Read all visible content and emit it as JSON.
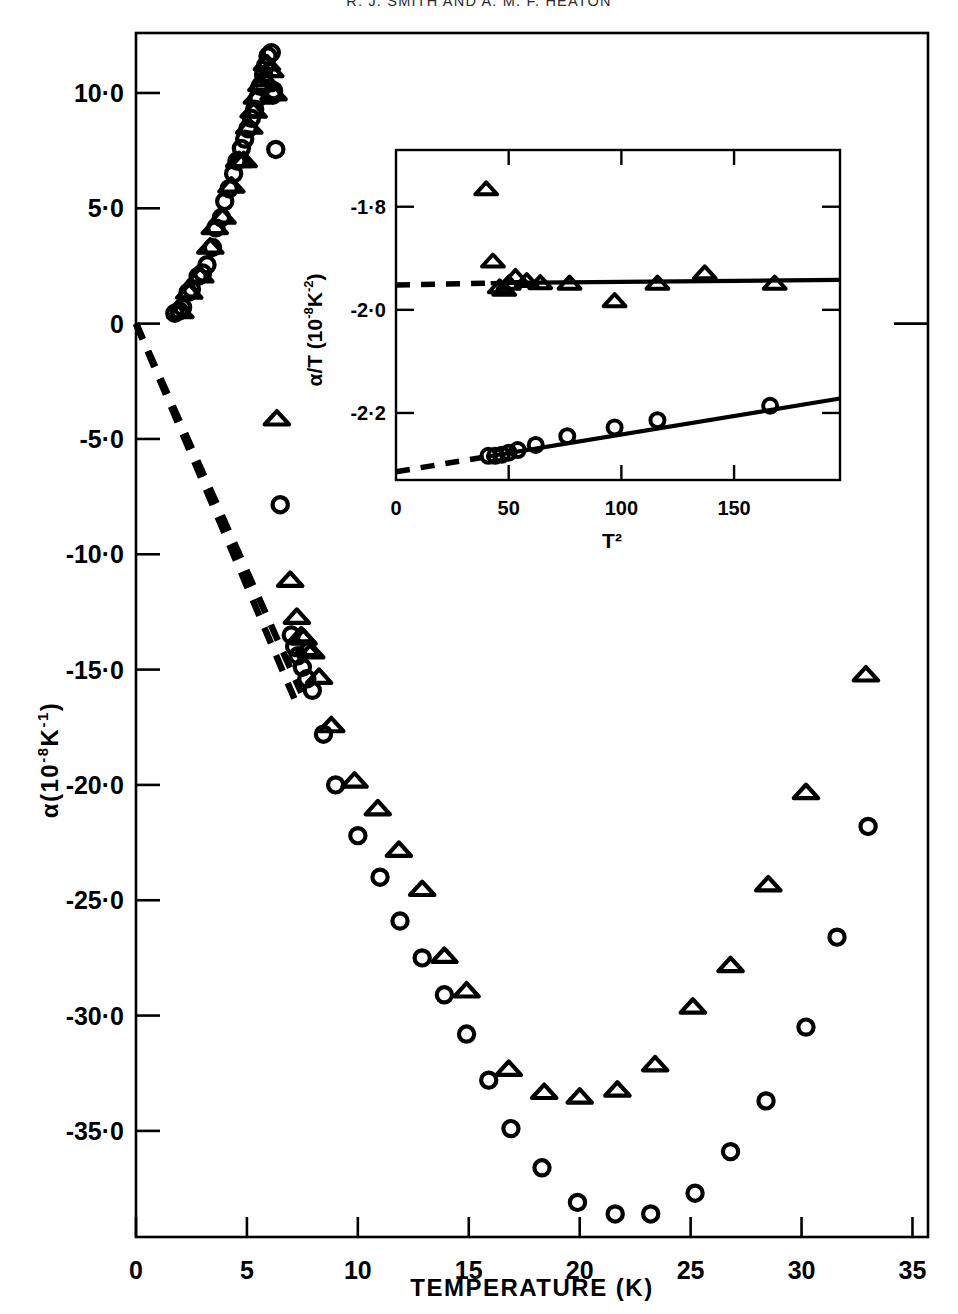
{
  "page": {
    "running_head": "R. J. SMITH AND A. M. F. HEATON"
  },
  "chart_data": {
    "type": "scatter",
    "title": "",
    "xlabel": "TEMPERATURE  (K)",
    "ylabel": "α(10⁻⁸K⁻¹)",
    "ylabel_parts": {
      "symbol": "α(10",
      "exp1": "-8",
      "mid": "K",
      "exp2": "-1",
      "close": ")"
    },
    "xlim": [
      0,
      35.7
    ],
    "ylim": [
      -39.6,
      12.6
    ],
    "xticks": [
      0,
      5,
      10,
      15,
      20,
      25,
      30,
      35
    ],
    "xticklabels": [
      "0",
      "5",
      "10",
      "15",
      "20",
      "25",
      "30",
      "35"
    ],
    "yticks": [
      10,
      5,
      0,
      -5,
      -10,
      -15,
      -20,
      -25,
      -30,
      -35
    ],
    "yticklabels": [
      "10·0",
      "5·0",
      "0",
      "-5·0",
      "-10·0",
      "-15·0",
      "-20·0",
      "-25·0",
      "-30·0",
      "-35·0"
    ],
    "grid": false,
    "legend": "none",
    "series": [
      {
        "name": "circles",
        "marker": "open-circle",
        "points": [
          [
            1.75,
            0.45
          ],
          [
            1.95,
            0.55
          ],
          [
            2.1,
            0.7
          ],
          [
            2.35,
            1.35
          ],
          [
            2.5,
            1.5
          ],
          [
            2.8,
            2.05
          ],
          [
            3.0,
            2.2
          ],
          [
            3.2,
            2.55
          ],
          [
            3.45,
            3.3
          ],
          [
            3.6,
            4.15
          ],
          [
            3.85,
            4.6
          ],
          [
            4.0,
            5.3
          ],
          [
            4.2,
            5.85
          ],
          [
            4.4,
            6.5
          ],
          [
            4.55,
            7.05
          ],
          [
            4.75,
            7.6
          ],
          [
            4.9,
            8.0
          ],
          [
            5.05,
            8.45
          ],
          [
            5.2,
            8.9
          ],
          [
            5.35,
            9.3
          ],
          [
            5.5,
            9.8
          ],
          [
            5.6,
            10.3
          ],
          [
            5.75,
            10.8
          ],
          [
            5.85,
            11.2
          ],
          [
            5.95,
            11.6
          ],
          [
            6.1,
            11.75
          ],
          [
            6.15,
            9.9
          ],
          [
            6.2,
            10.1
          ],
          [
            6.3,
            7.55
          ],
          [
            6.5,
            -7.85
          ],
          [
            7.0,
            -13.5
          ],
          [
            7.15,
            -14.0
          ],
          [
            7.3,
            -14.4
          ],
          [
            7.5,
            -14.9
          ],
          [
            7.7,
            -15.4
          ],
          [
            7.95,
            -15.9
          ],
          [
            8.45,
            -17.8
          ],
          [
            9.0,
            -20.0
          ],
          [
            10.0,
            -22.2
          ],
          [
            11.0,
            -24.0
          ],
          [
            11.9,
            -25.9
          ],
          [
            12.9,
            -27.5
          ],
          [
            13.9,
            -29.1
          ],
          [
            14.9,
            -30.8
          ],
          [
            15.9,
            -32.8
          ],
          [
            16.9,
            -34.9
          ],
          [
            18.3,
            -36.6
          ],
          [
            19.9,
            -38.1
          ],
          [
            21.6,
            -38.6
          ],
          [
            23.2,
            -38.6
          ],
          [
            25.2,
            -37.7
          ],
          [
            26.8,
            -35.9
          ],
          [
            28.4,
            -33.7
          ],
          [
            30.2,
            -30.5
          ],
          [
            31.6,
            -26.6
          ],
          [
            33.0,
            -21.8
          ]
        ]
      },
      {
        "name": "triangles",
        "marker": "open-triangle",
        "points": [
          [
            2.0,
            0.55
          ],
          [
            2.4,
            1.4
          ],
          [
            2.9,
            2.1
          ],
          [
            3.35,
            3.35
          ],
          [
            3.55,
            4.2
          ],
          [
            3.9,
            4.65
          ],
          [
            4.3,
            6.0
          ],
          [
            4.65,
            7.1
          ],
          [
            4.85,
            7.1
          ],
          [
            5.1,
            8.55
          ],
          [
            5.3,
            9.25
          ],
          [
            5.45,
            9.85
          ],
          [
            5.65,
            10.4
          ],
          [
            5.8,
            10.6
          ],
          [
            5.9,
            11.3
          ],
          [
            6.05,
            11.0
          ],
          [
            6.2,
            10.0
          ],
          [
            6.35,
            -4.1
          ],
          [
            6.95,
            -11.1
          ],
          [
            7.25,
            -12.7
          ],
          [
            7.45,
            -13.5
          ],
          [
            7.55,
            -13.6
          ],
          [
            7.7,
            -14.1
          ],
          [
            7.9,
            -14.2
          ],
          [
            8.25,
            -15.3
          ],
          [
            8.8,
            -17.4
          ],
          [
            9.85,
            -19.8
          ],
          [
            10.9,
            -21.0
          ],
          [
            11.85,
            -22.8
          ],
          [
            12.9,
            -24.5
          ],
          [
            13.9,
            -27.4
          ],
          [
            14.9,
            -28.9
          ],
          [
            16.8,
            -32.3
          ],
          [
            18.4,
            -33.3
          ],
          [
            20.0,
            -33.5
          ],
          [
            21.7,
            -33.2
          ],
          [
            23.4,
            -32.1
          ],
          [
            25.1,
            -29.6
          ],
          [
            26.8,
            -27.8
          ],
          [
            28.5,
            -24.3
          ],
          [
            30.2,
            -20.3
          ],
          [
            32.9,
            -15.2
          ]
        ]
      }
    ],
    "reference_lines": [
      {
        "name": "dashed-fit-upper",
        "style": "dashed",
        "from": [
          0,
          0
        ],
        "to": [
          7.45,
          -16.0
        ]
      },
      {
        "name": "dashed-fit-lower",
        "style": "dashed",
        "from": [
          0,
          0
        ],
        "to": [
          7.2,
          -16.4
        ]
      }
    ],
    "inset": {
      "type": "scatter",
      "xlabel": "T²",
      "ylabel": "α/T (10⁻⁸K⁻²)",
      "ylabel_parts": {
        "symbol": "α/T (10",
        "exp1": "-8",
        "mid": "K",
        "exp2": "-2",
        "close": ")"
      },
      "xlim": [
        0,
        197
      ],
      "ylim": [
        -2.33,
        -1.69
      ],
      "xticks": [
        0,
        50,
        100,
        150
      ],
      "xticklabels": [
        "0",
        "50",
        "100",
        "150"
      ],
      "yticks": [
        -1.8,
        -2.0,
        -2.2
      ],
      "yticklabels": [
        "-1·8",
        "-2·0",
        "-2·2"
      ],
      "grid": false,
      "series": [
        {
          "name": "triangles",
          "marker": "open-triangle",
          "points": [
            [
              40,
              -1.765
            ],
            [
              43,
              -1.905
            ],
            [
              46,
              -1.955
            ],
            [
              48,
              -1.96
            ],
            [
              50,
              -1.948
            ],
            [
              53,
              -1.935
            ],
            [
              58,
              -1.943
            ],
            [
              64,
              -1.947
            ],
            [
              77,
              -1.948
            ],
            [
              97,
              -1.982
            ],
            [
              116,
              -1.948
            ],
            [
              137,
              -1.928
            ],
            [
              168,
              -1.948
            ]
          ]
        },
        {
          "name": "circles",
          "marker": "open-circle",
          "points": [
            [
              41,
              -2.283
            ],
            [
              44,
              -2.283
            ],
            [
              47,
              -2.281
            ],
            [
              50,
              -2.277
            ],
            [
              54,
              -2.272
            ],
            [
              62,
              -2.262
            ],
            [
              76,
              -2.245
            ],
            [
              97,
              -2.228
            ],
            [
              116,
              -2.214
            ],
            [
              166,
              -2.186
            ]
          ]
        }
      ],
      "fit_lines": [
        {
          "name": "triangle-fit-solid",
          "style": "solid",
          "from": [
            42,
            -1.948
          ],
          "to": [
            197,
            -1.942
          ]
        },
        {
          "name": "triangle-fit-dashed",
          "style": "dashed",
          "from": [
            0,
            -1.952
          ],
          "to": [
            42,
            -1.948
          ]
        },
        {
          "name": "circle-fit-solid",
          "style": "solid",
          "from": [
            40,
            -2.285
          ],
          "to": [
            197,
            -2.172
          ]
        },
        {
          "name": "circle-fit-dashed",
          "style": "dashed",
          "from": [
            0,
            -2.314
          ],
          "to": [
            40,
            -2.285
          ]
        }
      ]
    }
  }
}
